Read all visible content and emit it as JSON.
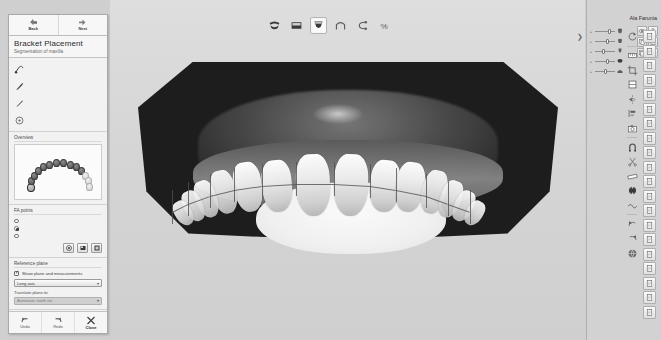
{
  "app": {
    "patient_name": "Ala Farunia",
    "background_color": "#cfcfcf",
    "panel_color": "#f2f2f2"
  },
  "left_panel": {
    "nav": {
      "back_label": "Back",
      "next_label": "Next"
    },
    "title": "Bracket Placement",
    "subtitle": "Segmentation of maxilla",
    "tools": [
      {
        "label": "Set points",
        "icon": "set-points-icon"
      },
      {
        "label": "Define cut",
        "icon": "define-cut-icon"
      },
      {
        "label": "Sculpt",
        "icon": "sculpt-icon"
      },
      {
        "label": "Rotation center",
        "icon": "rotation-center-icon"
      }
    ],
    "overview": {
      "header": "Overview",
      "arch_teeth_count": 14,
      "selected_index": 0
    },
    "fa_points": {
      "header": "FA points",
      "options": [
        {
          "label": "Move freely",
          "selected": false
        },
        {
          "label": "Move along vertical axis",
          "selected": true
        },
        {
          "label": "Move along horizontal axis",
          "selected": false
        }
      ],
      "buttons": [
        {
          "name": "reset-fa-points-button",
          "icon": "reset-icon"
        },
        {
          "name": "recalculate-fa-points-button",
          "icon": "recalculate-icon"
        },
        {
          "name": "apply-fa-points-button",
          "icon": "apply-icon"
        }
      ]
    },
    "reference_plane": {
      "header": "Reference plane",
      "show_checkbox_label": "Show plane and measurements",
      "show_checkbox_checked": true,
      "plane_select_value": "Long axis",
      "translate_label": "Translate plane to:",
      "translate_select_value": "Automatic tooth no.",
      "translate_select_disabled": true
    },
    "bottom": {
      "undo_label": "Undo",
      "redo_label": "Redo",
      "close_label": "Close"
    }
  },
  "top_toolbar": {
    "buttons": [
      {
        "name": "view-upper-jaw-button",
        "icon": "upper-jaw-icon",
        "active": false
      },
      {
        "name": "view-both-jaws-button",
        "icon": "both-jaws-icon",
        "active": false
      },
      {
        "name": "view-lower-jaw-button",
        "icon": "lower-jaw-icon",
        "active": true
      },
      {
        "name": "view-arch-button",
        "icon": "arch-icon",
        "active": false
      },
      {
        "name": "view-occlusion-button",
        "icon": "occlusion-icon",
        "active": false
      },
      {
        "name": "view-bracket-button",
        "icon": "bracket-icon",
        "active": false
      }
    ]
  },
  "right_panel": {
    "layers": [
      {
        "opacity": 0.8,
        "icon": "tooth-upper-icon"
      },
      {
        "opacity": 0.65,
        "icon": "tooth-crown-icon"
      },
      {
        "opacity": 0.45,
        "icon": "tooth-root-icon"
      },
      {
        "opacity": 0.7,
        "icon": "jaw-icon"
      },
      {
        "opacity": 0.55,
        "icon": "gum-icon"
      }
    ],
    "layer_buttons": [
      {
        "name": "layer-visibility-button",
        "icon": "eye-icon"
      },
      {
        "name": "layer-lock-button",
        "icon": "lock-icon"
      },
      {
        "name": "layer-copy-button",
        "icon": "copy-icon"
      },
      {
        "name": "layer-page-button",
        "icon": "page-icon"
      },
      {
        "name": "layer-duplicate-button",
        "icon": "duplicate-icon"
      },
      {
        "name": "layer-delete-button",
        "icon": "delete-icon"
      }
    ],
    "tool_column": [
      {
        "name": "rotate-tool",
        "icon": "rotate-icon"
      },
      {
        "name": "measure-tool",
        "icon": "measure-icon"
      },
      {
        "name": "crop-tool",
        "icon": "crop-icon"
      },
      {
        "name": "section-tool",
        "icon": "section-icon"
      },
      {
        "name": "mirror-tool",
        "icon": "mirror-icon"
      },
      {
        "name": "align-tool",
        "icon": "align-icon"
      },
      {
        "name": "photo-tool",
        "icon": "photo-icon"
      },
      {
        "name": "magnet-tool",
        "icon": "magnet-icon"
      },
      {
        "name": "scissors-tool",
        "icon": "scissors-icon"
      },
      {
        "name": "ruler-tool",
        "icon": "ruler-icon"
      },
      {
        "name": "bracket-tool",
        "icon": "bracket-tool-icon"
      },
      {
        "name": "wire-tool",
        "icon": "wire-icon"
      },
      {
        "name": "undo-view-tool",
        "icon": "undo-view-icon"
      },
      {
        "name": "redo-view-tool",
        "icon": "redo-view-icon"
      },
      {
        "name": "globe-tool",
        "icon": "globe-icon"
      }
    ],
    "doc_buttons": [
      {
        "name": "doc-page-1-button",
        "icon": "page-icon"
      },
      {
        "name": "doc-page-2-button",
        "icon": "page-icon"
      },
      {
        "name": "doc-page-3-button",
        "icon": "page-icon"
      },
      {
        "name": "doc-page-4-button",
        "icon": "page-icon"
      },
      {
        "name": "doc-page-5-button",
        "icon": "page-icon"
      },
      {
        "name": "doc-page-6-button",
        "icon": "page-icon"
      },
      {
        "name": "doc-page-7-button",
        "icon": "page-icon"
      },
      {
        "name": "doc-page-8-button",
        "icon": "page-icon"
      },
      {
        "name": "doc-page-9-button",
        "icon": "page-icon"
      },
      {
        "name": "doc-page-10-button",
        "icon": "page-icon"
      },
      {
        "name": "doc-page-11-button",
        "icon": "page-icon"
      },
      {
        "name": "doc-page-12-button",
        "icon": "page-icon"
      },
      {
        "name": "doc-page-13-button",
        "icon": "page-icon"
      },
      {
        "name": "doc-page-14-button",
        "icon": "page-icon"
      },
      {
        "name": "doc-page-15-button",
        "icon": "page-icon"
      },
      {
        "name": "doc-page-16-button",
        "icon": "page-icon"
      },
      {
        "name": "doc-page-17-button",
        "icon": "page-icon"
      },
      {
        "name": "doc-page-18-button",
        "icon": "page-icon"
      },
      {
        "name": "doc-page-19-button",
        "icon": "page-icon"
      },
      {
        "name": "doc-page-20-button",
        "icon": "page-icon"
      }
    ]
  },
  "viewport": {
    "model_label": "3D maxilla scan with bracket placement grid"
  }
}
